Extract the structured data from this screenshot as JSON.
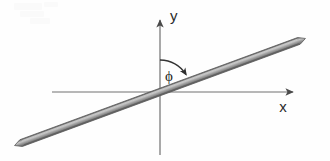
{
  "figure": {
    "background_color": "#fefefe",
    "width": 330,
    "height": 161,
    "axes": {
      "x_axis": {
        "label": "x",
        "label_x": 283,
        "label_y": 112,
        "start_x": 52,
        "start_y": 92,
        "end_x": 297,
        "end_y": 92,
        "color": "#6e6e6e",
        "arrow": "right"
      },
      "y_axis": {
        "label": "y",
        "label_x": 170,
        "label_y": 21,
        "start_x": 160,
        "start_y": 155,
        "end_x": 160,
        "end_y": 16,
        "color": "#6e6e6e",
        "arrow": "up"
      },
      "origin_x": 160,
      "origin_y": 92
    },
    "rod": {
      "name": "inclined-rod",
      "left_tip_x": 22,
      "left_tip_y": 144,
      "right_tip_x": 315,
      "right_tip_y": 36,
      "thickness": 7,
      "fill_color": "#9a9a9a",
      "edge_color_top": "#5a5a5a",
      "edge_color_bottom": "#6a6a6a",
      "highlight_color": "#c4c4c4"
    },
    "angle": {
      "symbol": "ϕ",
      "name": "phi",
      "label_x": 165,
      "label_y": 80,
      "arc_color": "#3a3a3a",
      "arc_start_x": 160,
      "arc_start_y": 60,
      "arc_end_x": 184,
      "arc_end_y": 76,
      "arc_radius": 32,
      "arrow_direction": "clockwise"
    }
  }
}
